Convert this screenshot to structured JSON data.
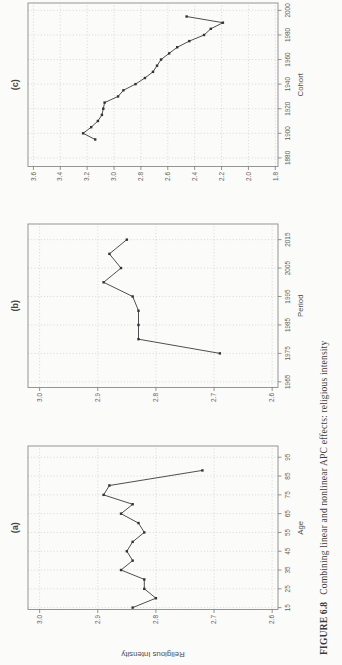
{
  "page": {
    "background": "#fbfbf9"
  },
  "caption": {
    "label": "FIGURE 6.8",
    "text": "Combining linear and nonlinear APC effects: religious intensity"
  },
  "style": {
    "line": "#3b3b3b",
    "marker": "#333333",
    "grid": "#c9c9c9",
    "box": "#8a8a8a",
    "tick": "#7a7a7a",
    "tick_text": "#636363",
    "axis_title": "#4f4f4f",
    "panel_title": "#454545"
  },
  "chart_data": [
    {
      "id": "panel-a",
      "type": "line",
      "title": "(a)",
      "xlabel": "Age",
      "ylabel": "Religious Intensity",
      "x": [
        15,
        20,
        25,
        30,
        35,
        40,
        45,
        50,
        55,
        60,
        65,
        70,
        75,
        80,
        88
      ],
      "y": [
        2.84,
        2.8,
        2.82,
        2.82,
        2.86,
        2.84,
        2.85,
        2.84,
        2.82,
        2.83,
        2.86,
        2.84,
        2.89,
        2.88,
        2.72
      ],
      "xlim": [
        14,
        101
      ],
      "ylim": [
        2.59,
        3.02
      ],
      "xticks": [
        15,
        25,
        35,
        45,
        55,
        65,
        75,
        85,
        95
      ],
      "yticks": [
        2.6,
        2.7,
        2.8,
        2.9,
        3.0
      ],
      "grid": true,
      "legend": null
    },
    {
      "id": "panel-b",
      "type": "line",
      "title": "(b)",
      "xlabel": "Period",
      "ylabel": "",
      "x": [
        1975,
        1980,
        1985,
        1990,
        1995,
        2000,
        2005,
        2010,
        2015
      ],
      "y": [
        2.69,
        2.83,
        2.83,
        2.83,
        2.84,
        2.89,
        2.86,
        2.88,
        2.85
      ],
      "xlim": [
        1963,
        2020.5
      ],
      "ylim": [
        2.59,
        3.02
      ],
      "xticks": [
        1965,
        1975,
        1985,
        1995,
        2005,
        2015
      ],
      "yticks": [
        2.6,
        2.7,
        2.8,
        2.9,
        3.0
      ],
      "grid": true,
      "legend": null
    },
    {
      "id": "panel-c",
      "type": "line",
      "title": "(c)",
      "xlabel": "Cohort",
      "ylabel": "",
      "x": [
        1895,
        1900,
        1905,
        1910,
        1915,
        1920,
        1925,
        1930,
        1935,
        1940,
        1945,
        1950,
        1955,
        1960,
        1965,
        1970,
        1975,
        1980,
        1985,
        1990,
        1995
      ],
      "y": [
        3.14,
        3.23,
        3.17,
        3.12,
        3.09,
        3.08,
        3.07,
        2.97,
        2.93,
        2.84,
        2.77,
        2.71,
        2.68,
        2.65,
        2.59,
        2.53,
        2.44,
        2.33,
        2.28,
        2.19,
        2.46
      ],
      "xlim": [
        1873,
        2006
      ],
      "ylim": [
        1.78,
        3.64
      ],
      "xticks": [
        1880,
        1900,
        1920,
        1940,
        1960,
        1980,
        2000
      ],
      "yticks": [
        1.8,
        2.0,
        2.2,
        2.4,
        2.6,
        2.8,
        3.0,
        3.2,
        3.4,
        3.6
      ],
      "grid": true,
      "legend": null
    }
  ]
}
